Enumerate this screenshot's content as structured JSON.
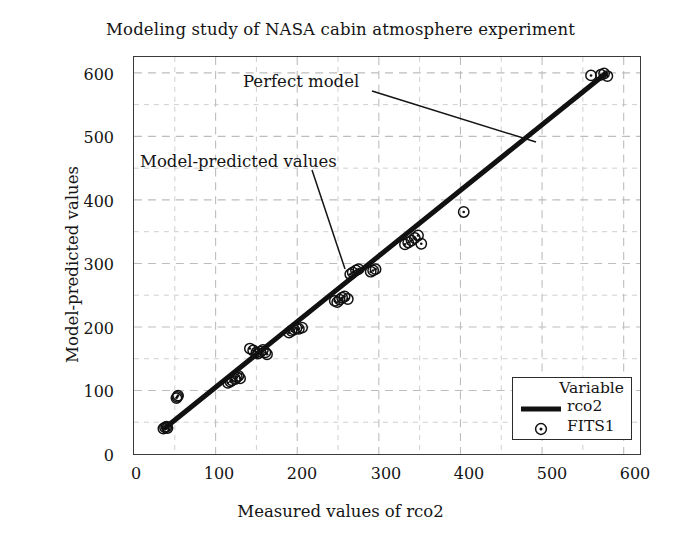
{
  "chart_data": {
    "type": "scatter",
    "title": "Modeling study of NASA cabin atmosphere experiment",
    "xlabel": "Measured values of rco2",
    "ylabel": "Model-predicted values",
    "xlim": [
      0,
      620
    ],
    "ylim": [
      0,
      625
    ],
    "xticks": [
      0,
      100,
      200,
      300,
      400,
      500,
      600
    ],
    "yticks": [
      0,
      100,
      200,
      300,
      400,
      500,
      600
    ],
    "grid": true,
    "grid_minor_step": 50,
    "legend_position": "bottom-right",
    "legend_title": "Variable",
    "series": [
      {
        "name": "rco2",
        "type": "line",
        "style": "thick-solid-black",
        "description": "Perfect model reference line (y = x)",
        "x": [
          38,
          578
        ],
        "values": [
          41,
          599
        ]
      },
      {
        "name": "FITS1",
        "type": "scatter",
        "marker": "circle-with-center-dot",
        "x": [
          36,
          38,
          40,
          41,
          52,
          53,
          54,
          115,
          118,
          120,
          124,
          126,
          128,
          130,
          142,
          146,
          150,
          152,
          155,
          158,
          161,
          163,
          190,
          193,
          196,
          199,
          202,
          206,
          246,
          249,
          252,
          255,
          258,
          262,
          265,
          268,
          272,
          275,
          290,
          293,
          296,
          332,
          336,
          340,
          344,
          348,
          352,
          404,
          560,
          572,
          576,
          580
        ],
        "values": [
          40,
          42,
          43,
          41,
          88,
          90,
          92,
          112,
          114,
          116,
          118,
          121,
          123,
          119,
          166,
          163,
          160,
          158,
          161,
          164,
          160,
          157,
          191,
          194,
          196,
          198,
          197,
          199,
          241,
          239,
          243,
          246,
          248,
          244,
          283,
          286,
          289,
          291,
          287,
          289,
          291,
          330,
          333,
          336,
          340,
          344,
          331,
          381,
          596,
          597,
          599,
          595
        ]
      }
    ],
    "annotations": [
      {
        "text": "Perfect model",
        "target": "reference-line"
      },
      {
        "text": "Model-predicted values",
        "target": "data-point-cluster"
      }
    ]
  },
  "chart": {
    "title": "Modeling study of NASA cabin atmosphere experiment",
    "x_axis": {
      "title": "Measured values of rco2",
      "tick_labels": [
        "0",
        "100",
        "200",
        "300",
        "400",
        "500",
        "600"
      ]
    },
    "y_axis": {
      "title": "Model-predicted values",
      "tick_labels": [
        "0",
        "100",
        "200",
        "300",
        "400",
        "500",
        "600"
      ]
    },
    "legend": {
      "title": "Variable",
      "entries": [
        {
          "label": "rco2",
          "key": "line-swatch"
        },
        {
          "label": "FITS1",
          "key": "circle-dot-marker"
        }
      ]
    },
    "annotations": {
      "perfect_model": "Perfect model",
      "model_predicted": "Model-predicted values"
    },
    "colors": {
      "line": "#111111",
      "marker_stroke": "#111111",
      "frame": "#3a3a3a",
      "grid": "#c9c9c9",
      "background": "#ffffff",
      "text": "#141414"
    }
  }
}
